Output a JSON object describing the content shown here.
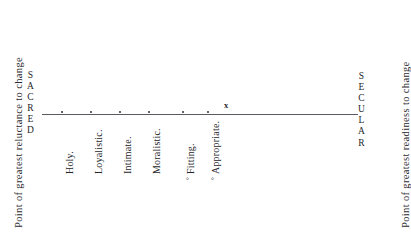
{
  "figure": {
    "axis": {
      "left_pole": "SACRED",
      "right_pole": "SECULAR",
      "left_caption": "Point of greatest reluctance to change",
      "right_caption": "Point of greatest readiness to change",
      "line_color": "#5a5a60",
      "point_marker": "x"
    },
    "items": [
      {
        "label": "Holy.",
        "marker": "",
        "x": 59
      },
      {
        "label": "Loyalistic.",
        "marker": "",
        "x": 88
      },
      {
        "label": "Intimate.",
        "marker": "",
        "x": 117
      },
      {
        "label": "Moralistic.",
        "marker": "",
        "x": 146
      },
      {
        "label": "Fitting.",
        "marker": "°",
        "x": 180
      },
      {
        "label": "Appropriate.",
        "marker": "°",
        "x": 205
      }
    ]
  },
  "chart_data": {
    "type": "scatter",
    "xlabel": "",
    "ylabel": "",
    "orientation": "horizontal-number-line",
    "grid": false,
    "legend": false,
    "axis_endpoints": [
      "SACRED",
      "SECULAR"
    ],
    "annotations": [
      "Point of greatest reluctance to change",
      "Point of greatest readiness to change"
    ],
    "categories": [
      "Holy",
      "Loyalistic",
      "Intimate",
      "Moralistic",
      "Fitting",
      "Appropriate"
    ],
    "x": [
      59,
      88,
      117,
      146,
      180,
      205
    ],
    "values": [
      1,
      2,
      3,
      4,
      5,
      6
    ],
    "tick_labels": [
      "Holy.",
      "Loyalistic.",
      "Intimate.",
      "Moralistic.",
      "Fitting.",
      "Appropriate."
    ],
    "point_marker_label": "x",
    "point_marker_x": 227,
    "xlim": [
      42,
      358
    ]
  }
}
